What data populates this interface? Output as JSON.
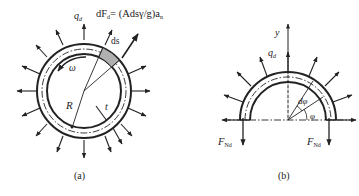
{
  "figure": {
    "panel_a": {
      "caption": "(a)",
      "load_label": "q",
      "load_sub": "d",
      "formula_lhs": "dF",
      "formula_lhs_sub": "d",
      "formula_rhs": "= (Adsγ/g)a",
      "formula_rhs_sub": "n",
      "element_label": "ds",
      "omega_label": "ω",
      "radius_label": "R",
      "thickness_label": "t"
    },
    "panel_b": {
      "caption": "(b)",
      "axis_label": "y",
      "load_label": "q",
      "load_sub": "d",
      "dphi_label": "dφ",
      "phi_label": "φ",
      "left_force": "F",
      "left_force_sub": "Nd",
      "right_force": "F",
      "right_force_sub": "Nd"
    },
    "colors": {
      "line": "#222222",
      "element_fill": "#b0b0b0",
      "background": "#ffffff"
    }
  }
}
